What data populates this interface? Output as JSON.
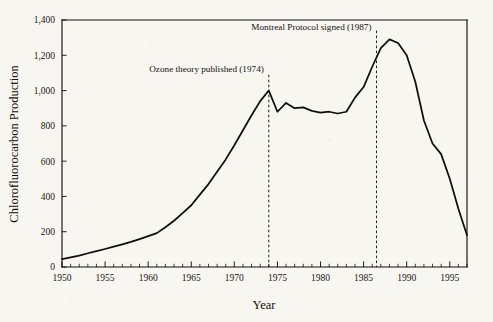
{
  "figure": {
    "background_color": "#f8f6f0",
    "ink_color": "#100d0b"
  },
  "chart_data": {
    "type": "line",
    "title": "",
    "xlabel": "Year",
    "ylabel": "Chlorofluorocarbon Production",
    "xlim": [
      1950,
      1997
    ],
    "ylim": [
      0,
      1400
    ],
    "grid": false,
    "legend": "none",
    "x_tick_labels": [
      "1950",
      "1955",
      "1960",
      "1965",
      "1970",
      "1975",
      "1980",
      "1985",
      "1990",
      "1995"
    ],
    "x_tick_values": [
      1950,
      1955,
      1960,
      1965,
      1970,
      1975,
      1980,
      1985,
      1990,
      1995
    ],
    "x_minor_tick_interval": 1,
    "y_tick_labels": [
      "0",
      "200",
      "400",
      "600",
      "800",
      "1,000",
      "1,200",
      "1,400"
    ],
    "y_tick_values": [
      0,
      200,
      400,
      600,
      800,
      1000,
      1200,
      1400
    ],
    "series": [
      {
        "name": "Chlorofluorocarbon Production",
        "x": [
          1950,
          1951,
          1952,
          1953,
          1954,
          1955,
          1956,
          1957,
          1958,
          1959,
          1960,
          1961,
          1962,
          1963,
          1964,
          1965,
          1966,
          1967,
          1968,
          1969,
          1970,
          1971,
          1972,
          1973,
          1974,
          1975,
          1976,
          1977,
          1978,
          1979,
          1980,
          1981,
          1982,
          1983,
          1984,
          1985,
          1986,
          1987,
          1988,
          1989,
          1990,
          1991,
          1992,
          1993,
          1994,
          1995,
          1996,
          1997
        ],
        "values": [
          45,
          55,
          65,
          78,
          90,
          102,
          115,
          128,
          142,
          158,
          175,
          192,
          225,
          262,
          305,
          350,
          410,
          470,
          540,
          610,
          690,
          775,
          860,
          940,
          1000,
          880,
          930,
          900,
          905,
          885,
          875,
          880,
          870,
          880,
          960,
          1020,
          1135,
          1240,
          1290,
          1270,
          1200,
          1050,
          830,
          700,
          640,
          500,
          330,
          180
        ]
      }
    ],
    "annotations": [
      {
        "id": "ozone-theory",
        "label": "Ozone theory published (1974)",
        "x": 1974,
        "line_style": "dashed",
        "line_top_value": 1090,
        "line_bottom_value": 0,
        "label_anchor": "end",
        "label_value": 1125
      },
      {
        "id": "montreal-protocol",
        "label": "Montreal Protocol signed (1987)",
        "x": 1986.5,
        "line_style": "dashed",
        "line_top_value": 1340,
        "line_bottom_value": 0,
        "label_anchor": "end",
        "label_value": 1360
      }
    ]
  }
}
